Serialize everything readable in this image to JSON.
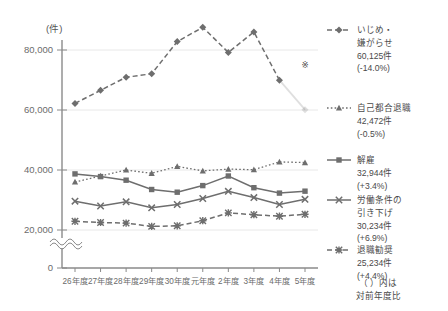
{
  "chart_data": {
    "type": "line",
    "title": "",
    "xlabel": "",
    "ylabel": "(件)",
    "axis_unit": "(件)",
    "ylim": [
      0,
      90000
    ],
    "yticks": [
      0,
      20000,
      40000,
      60000,
      80000
    ],
    "ytick_labels": [
      "0",
      "20,000",
      "40,000",
      "60,000",
      "80,000"
    ],
    "axis_break": true,
    "grid": true,
    "legend_position": "right",
    "categories": [
      "26年度",
      "27年度",
      "28年度",
      "29年度",
      "30年度",
      "元年度",
      "2年度",
      "3年度",
      "4年度",
      "5年度"
    ],
    "series": [
      {
        "name": "いじめ・嫌がらせ",
        "marker": "diamond",
        "linestyle": "dashed",
        "values": [
          62191,
          66566,
          70917,
          72067,
          82797,
          87570,
          79190,
          86034,
          69932,
          60125
        ],
        "last_value_label": "60,125件",
        "yoy_label": "(-14.0%)",
        "note_marker": "※"
      },
      {
        "name": "自己都合退職",
        "marker": "triangle",
        "linestyle": "dotted",
        "values": [
          36000,
          38000,
          40000,
          38900,
          41200,
          39700,
          40300,
          40100,
          42700,
          42472
        ],
        "last_value_label": "42,472件",
        "yoy_label": "(-0.5%)"
      },
      {
        "name": "解雇",
        "marker": "square",
        "linestyle": "solid",
        "values": [
          38700,
          37800,
          36600,
          33500,
          32600,
          34800,
          38000,
          34100,
          32300,
          32944
        ],
        "last_value_label": "32,944件",
        "yoy_label": "(+3.4%)"
      },
      {
        "name": "労働条件の引き下げ",
        "marker": "x",
        "linestyle": "solid",
        "values": [
          29600,
          28000,
          29400,
          27400,
          28500,
          30500,
          32900,
          30800,
          28500,
          30234
        ],
        "last_value_label": "30,234件",
        "yoy_label": "(+6.9%)"
      },
      {
        "name": "退職勧奨",
        "marker": "asterisk",
        "linestyle": "dashed",
        "values": [
          22900,
          22500,
          22300,
          21200,
          21400,
          23100,
          25700,
          25100,
          24600,
          25234
        ],
        "last_value_label": "25,234件",
        "yoy_label": "(+4.4%)"
      }
    ]
  },
  "legend": {
    "entries": [
      {
        "name": "いじめ・",
        "name2": "嫌がらせ",
        "value": "60,125件",
        "yoy": "(-14.0%)"
      },
      {
        "name": "自己都合退職",
        "name2": "",
        "value": "42,472件",
        "yoy": "(-0.5%)"
      },
      {
        "name": "解雇",
        "name2": "",
        "value": "32,944件",
        "yoy": "(+3.4%)"
      },
      {
        "name": "労働条件の",
        "name2": "引き下げ",
        "value": "30,234件",
        "yoy": "(+6.9%)"
      },
      {
        "name": "退職勧奨",
        "name2": "",
        "value": "25,234件",
        "yoy": "(+4.4%)"
      }
    ]
  },
  "footnote": {
    "line1": "（ ）内は",
    "line2": "対前年度比"
  },
  "plot_note": {
    "marker": "※"
  },
  "colors": {
    "line": "#6e6e6e",
    "axis": "#8a8a8a",
    "grid": "#e8e8e8",
    "text": "#555555"
  }
}
